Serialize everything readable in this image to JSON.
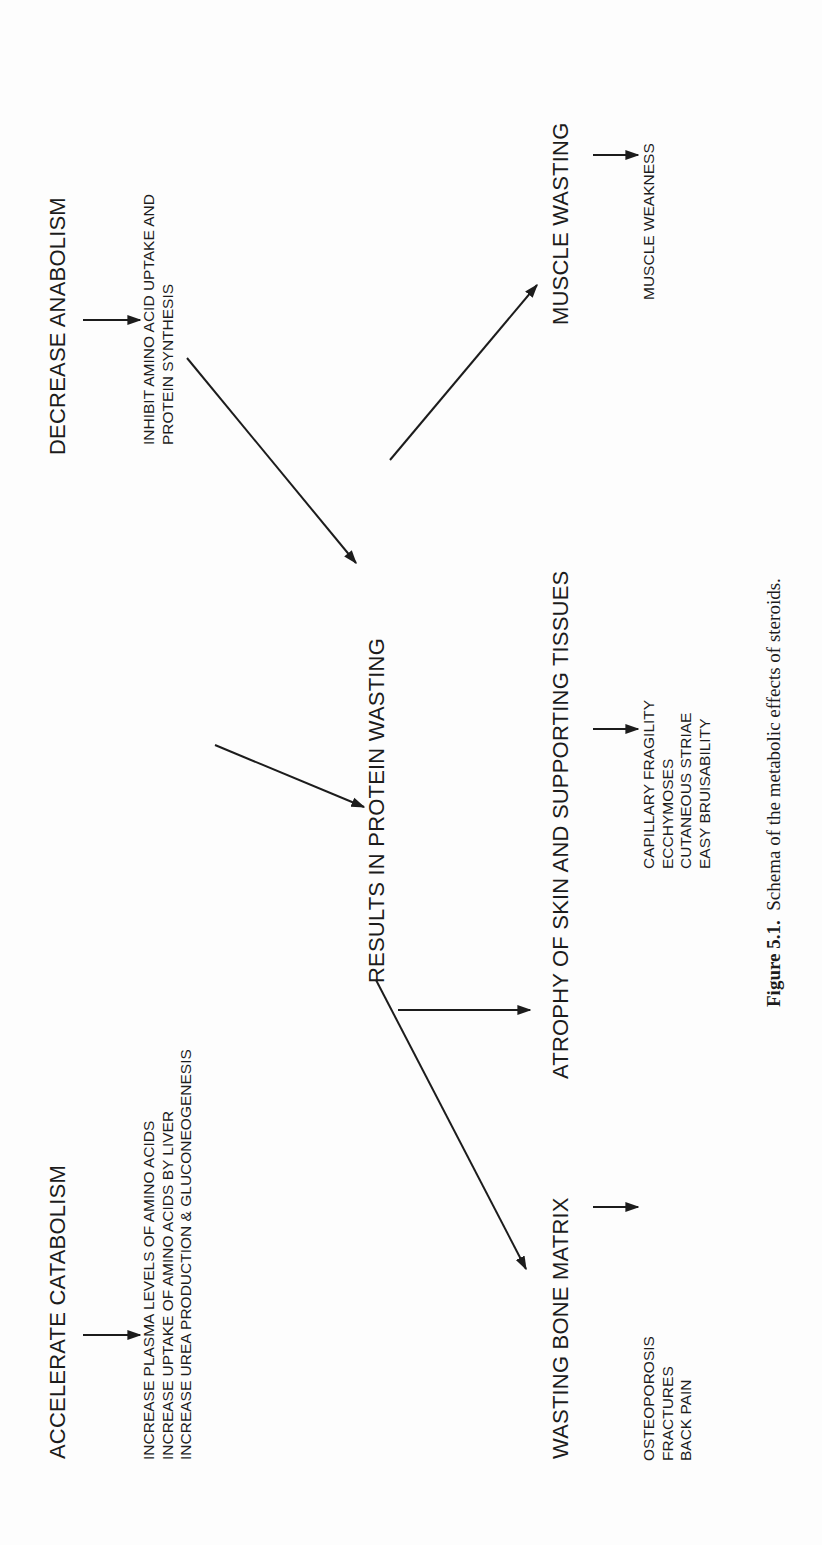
{
  "diagram": {
    "orientation": "rotated-90-ccw",
    "nodes": {
      "accelerate_catabolism": {
        "label": "ACCELERATE CATABOLISM"
      },
      "catabolism_effects": {
        "lines": [
          "INCREASE PLASMA LEVELS OF AMINO ACIDS",
          "INCREASE UPTAKE OF AMINO ACIDS BY LIVER",
          "INCREASE UREA PRODUCTION & GLUCONEOGENESIS"
        ]
      },
      "decrease_anabolism": {
        "label": "DECREASE ANABOLISM"
      },
      "anabolism_effects": {
        "lines": [
          "INHIBIT AMINO ACID UPTAKE AND",
          "PROTEIN SYNTHESIS"
        ]
      },
      "protein_wasting": {
        "label": "RESULTS IN PROTEIN WASTING"
      },
      "wasting_bone_matrix": {
        "label": "WASTING BONE MATRIX"
      },
      "bone_effects": {
        "lines": [
          "OSTEOPOROSIS",
          "FRACTURES",
          "BACK PAIN"
        ]
      },
      "atrophy_skin": {
        "label": "ATROPHY OF SKIN AND SUPPORTING TISSUES"
      },
      "skin_effects": {
        "lines": [
          "CAPILLARY FRAGILITY",
          "ECCHYMOSES",
          "CUTANEOUS STRIAE",
          "EASY BRUISABILITY"
        ]
      },
      "muscle_wasting": {
        "label": "MUSCLE WASTING"
      },
      "muscle_effects": {
        "lines": [
          "MUSCLE WEAKNESS"
        ]
      }
    },
    "edges": [
      {
        "from": "accelerate_catabolism",
        "to": "catabolism_effects",
        "type": "arrow"
      },
      {
        "from": "catabolism_effects",
        "to": "protein_wasting",
        "type": "arrow"
      },
      {
        "from": "decrease_anabolism",
        "to": "anabolism_effects",
        "type": "arrow"
      },
      {
        "from": "anabolism_effects",
        "to": "protein_wasting",
        "type": "arrow"
      },
      {
        "from": "protein_wasting",
        "to": "wasting_bone_matrix",
        "type": "arrow"
      },
      {
        "from": "protein_wasting",
        "to": "atrophy_skin",
        "type": "arrow"
      },
      {
        "from": "protein_wasting",
        "to": "muscle_wasting",
        "type": "arrow"
      },
      {
        "from": "wasting_bone_matrix",
        "to": "bone_effects",
        "type": "arrow"
      },
      {
        "from": "atrophy_skin",
        "to": "skin_effects",
        "type": "arrow"
      },
      {
        "from": "muscle_wasting",
        "to": "muscle_effects",
        "type": "arrow"
      }
    ],
    "caption": {
      "label": "Figure 5.1.",
      "text": "Schema of the metabolic effects of steroids."
    },
    "colors": {
      "ink": "#1c1c1c",
      "paper": "#fdfdfd"
    }
  }
}
